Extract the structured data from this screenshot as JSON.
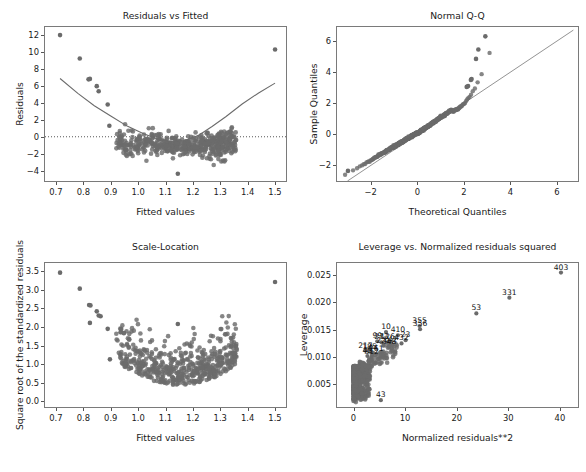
{
  "figure": {
    "width": 586,
    "height": 472,
    "background": "#ffffff",
    "marker_color": "#6b6b6b",
    "line_color": "#6b6b6b",
    "axis_color": "#7a7a7a",
    "text_color": "#1a1a1a"
  },
  "chart_data": [
    {
      "type": "scatter",
      "id": "residuals-vs-fitted",
      "title": "Residuals vs Fitted",
      "xlabel": "Fitted values",
      "ylabel": "Residuals",
      "xlim": [
        0.66,
        1.54
      ],
      "ylim": [
        -5.2,
        12.9
      ],
      "xticks": [
        "0.7",
        "0.8",
        "0.9",
        "1.0",
        "1.1",
        "1.2",
        "1.3",
        "1.4",
        "1.5"
      ],
      "xtickvals": [
        0.7,
        0.8,
        0.9,
        1.0,
        1.1,
        1.2,
        1.3,
        1.4,
        1.5
      ],
      "yticks": [
        "12",
        "10",
        "8",
        "6",
        "4",
        "2",
        "0",
        "−2",
        "−4"
      ],
      "ytickvals": [
        12,
        10,
        8,
        6,
        4,
        2,
        0,
        -2,
        -4
      ],
      "grid": false,
      "zero_line": {
        "y": 0,
        "style": "dotted",
        "color": "#444444"
      },
      "lowess": {
        "color": "#6b6b6b",
        "points": [
          [
            0.715,
            6.85
          ],
          [
            0.78,
            5.1
          ],
          [
            0.84,
            3.65
          ],
          [
            0.9,
            2.45
          ],
          [
            0.96,
            1.25
          ],
          [
            1.02,
            0.35
          ],
          [
            1.07,
            -0.25
          ],
          [
            1.12,
            -0.55
          ],
          [
            1.17,
            -0.45
          ],
          [
            1.22,
            0.15
          ],
          [
            1.27,
            1.2
          ],
          [
            1.32,
            2.35
          ],
          [
            1.38,
            3.85
          ],
          [
            1.44,
            5.15
          ],
          [
            1.5,
            6.3
          ]
        ]
      },
      "outlier_points": [
        [
          0.715,
          11.95
        ],
        [
          0.787,
          9.2
        ],
        [
          0.819,
          6.75
        ],
        [
          0.824,
          6.8
        ],
        [
          0.849,
          5.95
        ],
        [
          0.856,
          5.35
        ],
        [
          0.889,
          3.8
        ],
        [
          0.895,
          1.3
        ],
        [
          1.5,
          10.25
        ],
        [
          1.145,
          -4.35
        ]
      ],
      "n_points": 520,
      "cloud_description": "U-shaped band of residuals; dense near y=-1 at center, widening upward at both ends"
    },
    {
      "type": "scatter",
      "id": "normal-qq",
      "title": "Normal Q-Q",
      "xlabel": "Theoretical Quantiles",
      "ylabel": "Sample Quantiles",
      "xlim": [
        -3.45,
        6.9
      ],
      "ylim": [
        -3.0,
        6.9
      ],
      "xticks": [
        "−2",
        "0",
        "2",
        "4",
        "6"
      ],
      "xtickvals": [
        -2,
        0,
        2,
        4,
        6
      ],
      "yticks": [
        "6",
        "4",
        "2",
        "0",
        "−2"
      ],
      "ytickvals": [
        6,
        4,
        2,
        0,
        -2
      ],
      "grid": false,
      "reference_line": {
        "from": [
          -3.0,
          -3.0
        ],
        "to": [
          6.7,
          6.7
        ],
        "color": "#777777"
      },
      "n_points": 520,
      "outlier_points": [
        [
          2.92,
          6.3
        ],
        [
          2.62,
          5.45
        ],
        [
          2.52,
          4.85
        ],
        [
          2.33,
          3.55
        ],
        [
          2.3,
          3.5
        ],
        [
          2.18,
          3.1
        ],
        [
          2.12,
          3.05
        ],
        [
          -2.98,
          -2.35
        ]
      ],
      "cloud_description": "S-curve of ordered quantiles above the 45-degree reference line in the upper tail"
    },
    {
      "type": "scatter",
      "id": "scale-location",
      "title": "Scale-Location",
      "xlabel": "Fitted values",
      "ylabel": "Square root of the standardized residuals",
      "xlim": [
        0.66,
        1.54
      ],
      "ylim": [
        -0.15,
        3.72
      ],
      "xticks": [
        "0.7",
        "0.8",
        "0.9",
        "1.0",
        "1.1",
        "1.2",
        "1.3",
        "1.4",
        "1.5"
      ],
      "xtickvals": [
        0.7,
        0.8,
        0.9,
        1.0,
        1.1,
        1.2,
        1.3,
        1.4,
        1.5
      ],
      "yticks": [
        "3.5",
        "3.0",
        "2.5",
        "2.0",
        "1.5",
        "1.0",
        "0.5",
        "0.0"
      ],
      "ytickvals": [
        3.5,
        3.0,
        2.5,
        2.0,
        1.5,
        1.0,
        0.5,
        0.0
      ],
      "grid": false,
      "n_points": 520,
      "outlier_points": [
        [
          0.715,
          3.46
        ],
        [
          0.787,
          3.03
        ],
        [
          0.821,
          2.59
        ],
        [
          0.826,
          2.58
        ],
        [
          0.849,
          2.42
        ],
        [
          0.856,
          2.31
        ],
        [
          0.863,
          2.29
        ],
        [
          0.889,
          1.95
        ],
        [
          0.824,
          2.11
        ],
        [
          0.897,
          1.13
        ],
        [
          1.5,
          3.21
        ],
        [
          1.145,
          2.08
        ]
      ],
      "cloud_description": "U-shaped spread of sqrt standardized residuals, lowest near the center of fitted values"
    },
    {
      "type": "scatter",
      "id": "leverage-vs-normalized-residuals-squared",
      "title": "Leverage vs. Normalized residuals squared",
      "xlabel": "Normalized residuals**2",
      "ylabel": "Leverage",
      "xlim": [
        -3.2,
        43.5
      ],
      "ylim": [
        0.0008,
        0.0272
      ],
      "xticks": [
        "0",
        "10",
        "20",
        "30",
        "40"
      ],
      "xtickvals": [
        0,
        10,
        20,
        30,
        40
      ],
      "yticks": [
        "0.025",
        "0.020",
        "0.015",
        "0.010",
        "0.005"
      ],
      "ytickvals": [
        0.025,
        0.02,
        0.015,
        0.01,
        0.005
      ],
      "grid": false,
      "n_points": 520,
      "labeled_points": [
        {
          "label": "403",
          "x": 40.2,
          "y": 0.02545
        },
        {
          "label": "331",
          "x": 30.2,
          "y": 0.02085
        },
        {
          "label": "53",
          "x": 23.8,
          "y": 0.01795
        },
        {
          "label": "355",
          "x": 12.8,
          "y": 0.01565
        },
        {
          "label": "356",
          "x": 12.9,
          "y": 0.01505
        },
        {
          "label": "10",
          "x": 6.3,
          "y": 0.01455
        },
        {
          "label": "410",
          "x": 8.6,
          "y": 0.01395
        },
        {
          "label": "23",
          "x": 10.1,
          "y": 0.01305
        },
        {
          "label": "99",
          "x": 4.6,
          "y": 0.01285
        },
        {
          "label": "273",
          "x": 5.4,
          "y": 0.01265
        },
        {
          "label": "126",
          "x": 6.6,
          "y": 0.01265
        },
        {
          "label": "432",
          "x": 9.3,
          "y": 0.01245
        },
        {
          "label": "142",
          "x": 7.1,
          "y": 0.01225
        },
        {
          "label": "221",
          "x": 5.8,
          "y": 0.01205
        },
        {
          "label": "348",
          "x": 6.9,
          "y": 0.01185
        },
        {
          "label": "217",
          "x": 2.3,
          "y": 0.01115
        },
        {
          "label": "185",
          "x": 3.1,
          "y": 0.01095
        },
        {
          "label": "44",
          "x": 3.8,
          "y": 0.01075
        },
        {
          "label": "261",
          "x": 4.4,
          "y": 0.01055
        },
        {
          "label": "45",
          "x": 2.7,
          "y": 0.01015
        },
        {
          "label": "312",
          "x": 3.5,
          "y": 0.00995
        },
        {
          "label": "43",
          "x": 5.3,
          "y": 0.00205
        }
      ],
      "cloud_description": "Dense vertical mass of low-leverage points near x=0 rising diagonally to high-leverage outliers"
    }
  ]
}
